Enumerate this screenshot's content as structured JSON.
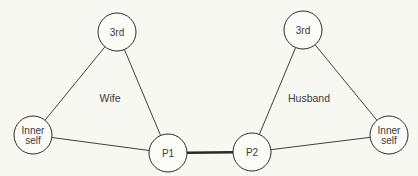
{
  "diagram": {
    "colors": {
      "background": "#f8f8f3",
      "stroke": "#2a2a2a",
      "node_fill": "#fbfbf8",
      "text": "#3a3a3a"
    },
    "triangles": [
      {
        "label": "Wife",
        "label_pos": [
          110,
          102
        ]
      },
      {
        "label": "Husband",
        "label_pos": [
          309,
          102
        ]
      }
    ],
    "nodes": {
      "wife_third": {
        "lines": [
          "3rd"
        ],
        "cx": 117,
        "cy": 32,
        "r": 19
      },
      "wife_inner": {
        "lines": [
          "Inner",
          "self"
        ],
        "cx": 33,
        "cy": 135,
        "r": 19
      },
      "p1": {
        "lines": [
          "P1"
        ],
        "cx": 168,
        "cy": 153,
        "r": 19
      },
      "p2": {
        "lines": [
          "P2"
        ],
        "cx": 252,
        "cy": 152,
        "r": 19
      },
      "husband_third": {
        "lines": [
          "3rd"
        ],
        "cx": 303,
        "cy": 30,
        "r": 19
      },
      "husband_inner": {
        "lines": [
          "Inner",
          "self"
        ],
        "cx": 389,
        "cy": 135,
        "r": 19
      }
    },
    "edges": [
      {
        "from": "wife_third",
        "to": "wife_inner",
        "weight": "thin"
      },
      {
        "from": "wife_third",
        "to": "p1",
        "weight": "thin"
      },
      {
        "from": "wife_inner",
        "to": "p1",
        "weight": "thin"
      },
      {
        "from": "p1",
        "to": "p2",
        "weight": "thick"
      },
      {
        "from": "husband_third",
        "to": "p2",
        "weight": "thin"
      },
      {
        "from": "husband_third",
        "to": "husband_inner",
        "weight": "thin"
      },
      {
        "from": "p2",
        "to": "husband_inner",
        "weight": "thin"
      }
    ]
  }
}
